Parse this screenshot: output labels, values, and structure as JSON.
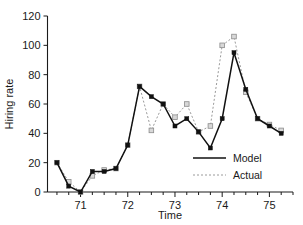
{
  "chart_data": {
    "type": "line",
    "title": "",
    "xlabel": "Time",
    "ylabel": "Hiring rate",
    "xlim": [
      70.3,
      75.5
    ],
    "ylim": [
      0,
      120
    ],
    "yticks": [
      0,
      20,
      40,
      60,
      80,
      100,
      120
    ],
    "xticks": [
      71,
      72,
      73,
      74,
      75
    ],
    "xminor_step": 0.25,
    "grid": false,
    "legend_position": "lower-right",
    "x": [
      70.5,
      70.75,
      71.0,
      71.25,
      71.5,
      71.75,
      72.0,
      72.25,
      72.5,
      72.75,
      73.0,
      73.25,
      73.5,
      73.75,
      74.0,
      74.25,
      74.5,
      74.75,
      75.0,
      75.25
    ],
    "series": [
      {
        "name": "Model",
        "style": "solid",
        "color": "#111111",
        "marker": "filled-square",
        "values": [
          20,
          4,
          0,
          14,
          14,
          16,
          32,
          72,
          65,
          60,
          45,
          50,
          41,
          30,
          50,
          95,
          70,
          50,
          45,
          40
        ]
      },
      {
        "name": "Actual",
        "style": "dotted",
        "color": "#9a9a9a",
        "marker": "open-square",
        "values": [
          20,
          7,
          0,
          11,
          15,
          16,
          32,
          72,
          42,
          60,
          51,
          60,
          41,
          45,
          100,
          106,
          68,
          50,
          46,
          42
        ]
      }
    ]
  },
  "legend": {
    "items": [
      {
        "label": "Model",
        "style": "solid"
      },
      {
        "label": "Actual",
        "style": "dotted"
      }
    ]
  },
  "axes": {
    "y_title": "Hiring rate",
    "x_title": "Time",
    "y_tick_labels": [
      "0",
      "20",
      "40",
      "60",
      "80",
      "100",
      "120"
    ],
    "x_tick_labels": [
      "71",
      "72",
      "73",
      "74",
      "75"
    ]
  }
}
